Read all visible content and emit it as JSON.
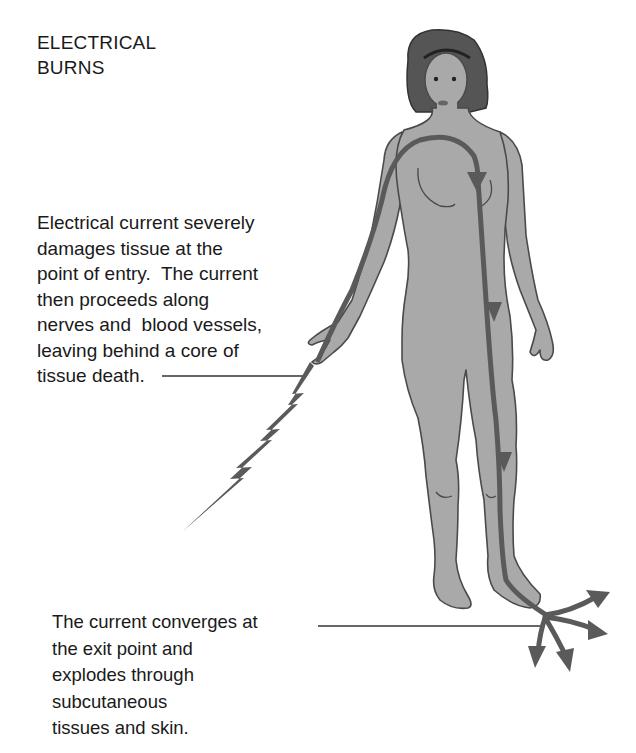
{
  "title": {
    "lines": [
      "ELECTRICAL",
      "BURNS"
    ]
  },
  "callouts": {
    "entry": {
      "lines": [
        "Electrical current severely",
        "damages tissue at the",
        "point of entry.  The current",
        "then proceeds along",
        "nerves and  blood vessels,",
        "leaving behind a core of",
        "tissue death."
      ]
    },
    "exit": {
      "lines": [
        "The current converges at",
        "the exit point and",
        "explodes through",
        "subcutaneous",
        "tissues and skin."
      ]
    }
  },
  "illustration": {
    "subject": "standing female figure",
    "current_path": "enters right hand, travels up arm, across chest, down left side and leg, exits at foot",
    "icons": [
      "lightning-bolt-icon",
      "current-path-arrow-icon",
      "exit-burst-arrows-icon"
    ],
    "colors": {
      "skin": "#a9a9a9",
      "outline": "#4a4a4a",
      "hair": "#555555",
      "current": "#5a5a5a",
      "text": "#1a1a1a"
    }
  }
}
